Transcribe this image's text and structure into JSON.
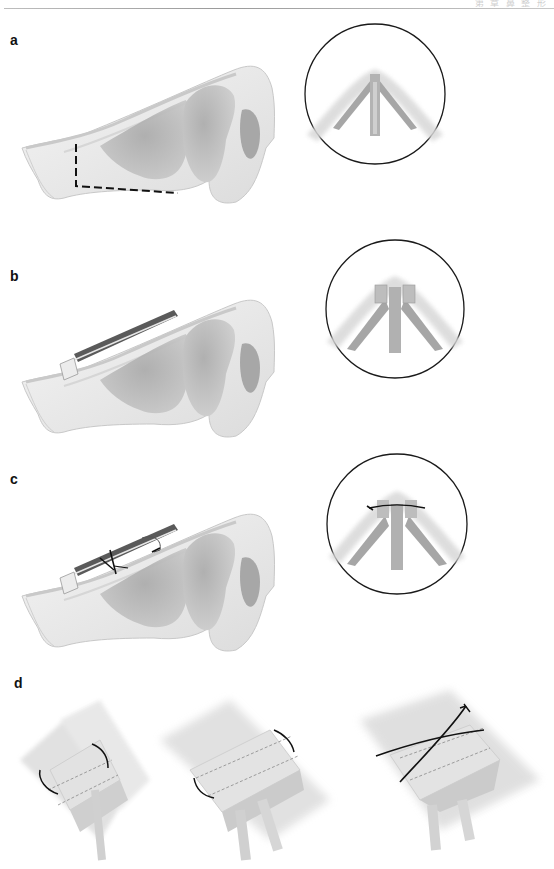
{
  "header": {
    "running_text": "第  章  鼻 整 形"
  },
  "figure": {
    "panels": [
      {
        "id": "a",
        "label": "a",
        "description": "Lateral nose view with dashed incision outline and cross-section inset showing septum and lateral crura"
      },
      {
        "id": "b",
        "label": "b",
        "description": "Lateral nose view with spreader graft placed along dorsum and inset showing grafts beside septum"
      },
      {
        "id": "c",
        "label": "c",
        "description": "Lateral nose view with sutures securing spreader grafts and inset showing horizontal mattress suture"
      },
      {
        "id": "d",
        "label": "d",
        "description": "Three-step perspective illustration of graft fixation sutures: single suture, paired sutures, crossing sutures"
      }
    ]
  },
  "colors": {
    "line": "#111111",
    "tissue_light": "#e4e4e4",
    "tissue_mid": "#b8b8b8",
    "tissue_dark": "#8f8f8f",
    "inset_circle": "#1a1a1a"
  }
}
